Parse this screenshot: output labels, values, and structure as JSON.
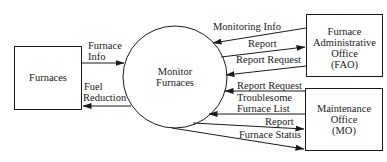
{
  "diagram": {
    "type": "data-flow-diagram",
    "process": {
      "label_line1": "Monitor",
      "label_line2": "Furnaces"
    },
    "entities": {
      "furnaces": {
        "label": "Furnaces"
      },
      "fao": {
        "line1": "Furnace",
        "line2": "Administrative",
        "line3": "Office",
        "line4": "(FAO)"
      },
      "mo": {
        "line1": "Maintenance",
        "line2": "Office",
        "line3": "(MO)"
      }
    },
    "flows": {
      "furnace_info": {
        "line1": "Furnace",
        "line2": "Info",
        "from": "Furnaces",
        "to": "Monitor Furnaces"
      },
      "fuel_reduction": {
        "line1": "Fuel",
        "line2": "Reduction",
        "from": "Monitor Furnaces",
        "to": "Furnaces"
      },
      "monitoring_info": {
        "label": "Monitoring Info",
        "from": "FAO",
        "to": "Monitor Furnaces"
      },
      "report_fao": {
        "label": "Report",
        "from": "Monitor Furnaces",
        "to": "FAO"
      },
      "report_request_fao": {
        "label": "Report Request",
        "from": "FAO",
        "to": "Monitor Furnaces"
      },
      "report_request_mo": {
        "label": "Report Request",
        "from": "MO",
        "to": "Monitor Furnaces"
      },
      "troublesome_list": {
        "line1": "Troublesome",
        "line2": "Furnace List",
        "from": "MO",
        "to": "Monitor Furnaces"
      },
      "report_mo": {
        "label": "Report",
        "from": "Monitor Furnaces",
        "to": "MO"
      },
      "furnace_status": {
        "label": "Furnace Status",
        "from": "Monitor Furnaces",
        "to": "MO"
      }
    }
  }
}
